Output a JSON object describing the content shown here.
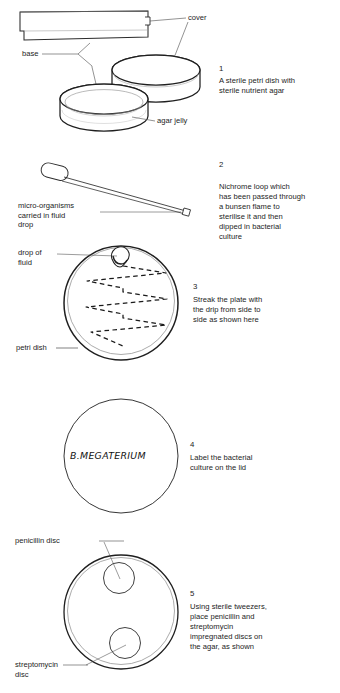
{
  "figure": {
    "title_present": false,
    "steps": [
      {
        "number": "1",
        "text": "A sterile petri dish with\nsterile nutrient agar",
        "labels": [
          {
            "name": "cover",
            "text": "cover"
          },
          {
            "name": "base",
            "text": "base"
          },
          {
            "name": "agar-jelly",
            "text": "agar jelly"
          }
        ]
      },
      {
        "number": "2",
        "text": "Nichrome loop which\nhas been passed through\na bunsen flame to\nsterilise it and then\ndipped in bacterial\nculture",
        "labels": [
          {
            "name": "micro-organisms",
            "text": "micro-organisms\ncarried in fluid\ndrop"
          }
        ]
      },
      {
        "number": "3",
        "text": "Streak the plate with\nthe drip from side to\nside as shown here",
        "labels": [
          {
            "name": "drop-of-fluid",
            "text": "drop of\nfluid"
          },
          {
            "name": "petri-dish",
            "text": "petri dish"
          }
        ]
      },
      {
        "number": "4",
        "text": "Label the bacterial\nculture on the lid",
        "labels": [],
        "handwritten_label": "B.MEGATERIUM"
      },
      {
        "number": "5",
        "text": "Using sterile tweezers,\nplace penicillin and\nstreptomycin\nimpregnated discs on\nthe agar, as shown",
        "labels": [
          {
            "name": "penicillin-disc",
            "text": "penicillin disc"
          },
          {
            "name": "streptomycin-disc",
            "text": "streptomycin\ndisc"
          }
        ]
      }
    ]
  },
  "colors": {
    "ink": "#1d1d1d",
    "line": "#2b2b2b",
    "line_light": "#6f6f6f",
    "background": "#ffffff"
  }
}
